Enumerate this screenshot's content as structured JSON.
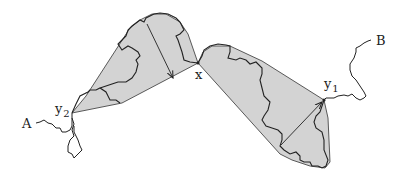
{
  "diagram": {
    "colors": {
      "hull_fill": "#d3d3d3",
      "stroke": "#222222",
      "background": "#ffffff"
    },
    "labels": {
      "A": "A",
      "B": "B",
      "x": "x",
      "y1_base": "y",
      "y1_sub": "1",
      "y2_base": "y",
      "y2_sub": "2"
    },
    "nodes": [
      {
        "id": "A",
        "x": 35,
        "y": 123
      },
      {
        "id": "y2",
        "x": 72,
        "y": 113
      },
      {
        "id": "x",
        "x": 198,
        "y": 63
      },
      {
        "id": "y1",
        "x": 324,
        "y": 100
      },
      {
        "id": "B",
        "x": 370,
        "y": 40
      }
    ],
    "arrows": [
      {
        "from": [
          147,
          24
        ],
        "to": [
          173,
          78
        ]
      },
      {
        "from": [
          281,
          145
        ],
        "to": [
          322,
          102
        ]
      }
    ]
  }
}
